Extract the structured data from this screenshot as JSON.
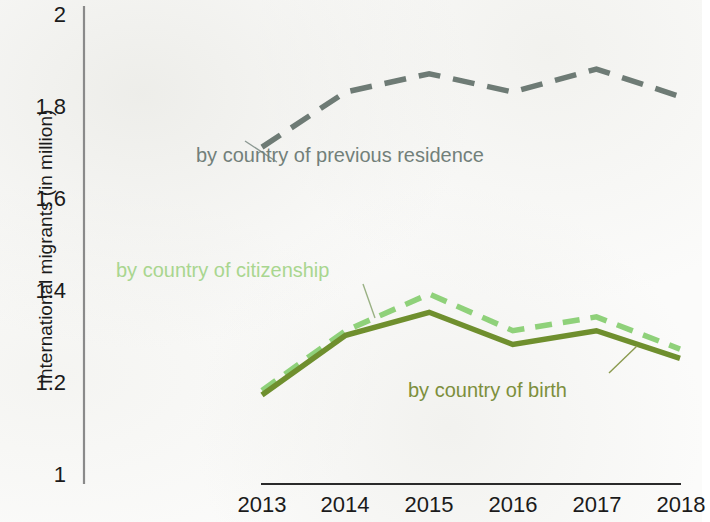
{
  "chart_data": {
    "type": "line",
    "title": "",
    "xlabel": "",
    "ylabel": "International migrants (in million)",
    "x": [
      "2013",
      "2014",
      "2015",
      "2016",
      "2017",
      "2018"
    ],
    "categories": [
      "2013",
      "2014",
      "2015",
      "2016",
      "2017",
      "2018"
    ],
    "ylim": [
      1,
      2
    ],
    "yticks": [
      "1",
      "1.2",
      "1.4",
      "1.6",
      "1.8",
      "2"
    ],
    "ytick_values": [
      1,
      1.2,
      1.4,
      1.6,
      1.8,
      2
    ],
    "grid": false,
    "legend_position": "inline-annotations",
    "series": [
      {
        "name": "by country of previous residence",
        "values": [
          1.71,
          1.83,
          1.87,
          1.83,
          1.88,
          1.82
        ],
        "color": "#6e7b75",
        "style": "dashed"
      },
      {
        "name": "by country of citizenship",
        "values": [
          1.18,
          1.31,
          1.39,
          1.31,
          1.34,
          1.27
        ],
        "color": "#8fd17a",
        "style": "dashed"
      },
      {
        "name": "by country of birth",
        "values": [
          1.17,
          1.3,
          1.35,
          1.28,
          1.31,
          1.25
        ],
        "color": "#6f8f2e",
        "style": "solid"
      }
    ],
    "annotations": [
      {
        "text": "by country of previous residence",
        "series": "by country of previous residence"
      },
      {
        "text": "by country of citizenship",
        "series": "by country of citizenship"
      },
      {
        "text": "by country of birth",
        "series": "by country of birth"
      }
    ]
  },
  "axis": {
    "y_labels": [
      "2",
      "1.8",
      "1.6",
      "1.4",
      "1.2",
      "1"
    ],
    "x_labels": [
      "2013",
      "2014",
      "2015",
      "2016",
      "2017",
      "2018"
    ],
    "y_title": "International migrants (in million)"
  },
  "annotations": {
    "previous_residence": "by country of previous residence",
    "citizenship": "by country of citizenship",
    "birth": "by country of birth"
  }
}
